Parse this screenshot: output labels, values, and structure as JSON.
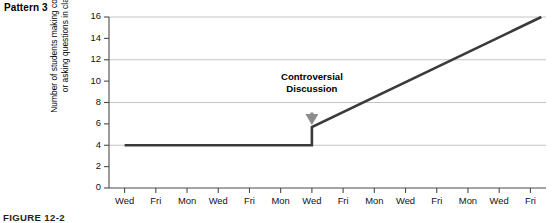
{
  "pattern_label": "Pattern 3",
  "figure_caption": "FIGURE 12-2",
  "colors": {
    "data_line": "#3a3a3a",
    "gridline": "#bdbdbd",
    "axis": "#4a4a4a",
    "arrow": "#8c8c8c",
    "text": "#000000"
  },
  "chart_data": {
    "type": "line",
    "title": "Pattern 3",
    "xlabel": "",
    "ylabel": "Number of students making comments or asking questions in class",
    "ylabel_lines": [
      "Number of students making comments",
      "or asking questions in class"
    ],
    "ylim": [
      0,
      16
    ],
    "ytick_values": [
      0,
      2,
      4,
      6,
      8,
      10,
      12,
      14,
      16
    ],
    "ytick_labels": [
      "0",
      "2",
      "4",
      "6",
      "8",
      "10",
      "12",
      "14",
      "16"
    ],
    "gridlines_y": [
      4,
      8,
      12,
      16
    ],
    "grid": "horizontal",
    "legend": "none",
    "categories": [
      "Wed",
      "Fri",
      "Mon",
      "Wed",
      "Fri",
      "Mon",
      "Wed",
      "Fri",
      "Mon",
      "Wed",
      "Fri",
      "Mon",
      "Wed",
      "Fri"
    ],
    "xtick_labels": [
      "Wed",
      "Fri",
      "Mon",
      "Wed",
      "Fri",
      "Mon",
      "Wed",
      "Fri",
      "Mon",
      "Wed",
      "Fri",
      "Mon",
      "Wed",
      "Fri"
    ],
    "series": [
      {
        "name": "Number of students making comments or asking questions in class",
        "points": [
          {
            "x": 0,
            "y": 4
          },
          {
            "x": 6,
            "y": 4
          },
          {
            "x": 6,
            "y": 5.7
          },
          {
            "x": 13.35,
            "y": 16
          }
        ],
        "description": "Flat baseline at 4 for the first seven sessions, an abrupt vertical jump to about 5.7 at the seventh session, then a steady linear increase to 16."
      }
    ],
    "annotations": [
      {
        "text": "Controversial Discussion",
        "lines": [
          "Controversial",
          "Discussion"
        ],
        "at_category": "Wed",
        "at_x_index": 6,
        "marker": "down-arrow",
        "points_to_y": 5.7
      }
    ]
  }
}
